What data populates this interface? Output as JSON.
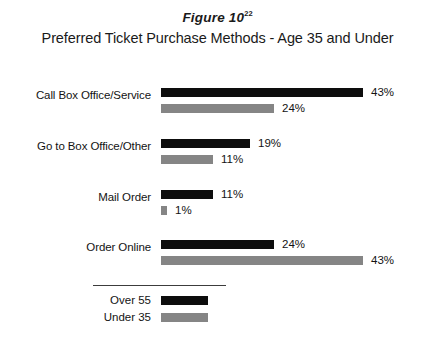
{
  "figure": {
    "number_label": "Figure 10",
    "footnote_marker": "22",
    "title": "Preferred Ticket Purchase Methods - Age 35 and Under"
  },
  "legend": {
    "items": [
      {
        "label": "Over 55",
        "series_key": "over55",
        "color": "#0d0d0d"
      },
      {
        "label": "Under 35",
        "series_key": "under35",
        "color": "#858585"
      }
    ]
  },
  "chart_data": {
    "type": "bar",
    "orientation": "horizontal",
    "title": "Preferred Ticket Purchase Methods - Age 35 and Under",
    "xlabel": "",
    "ylabel": "",
    "grid": false,
    "legend_position": "bottom",
    "value_suffix": "%",
    "xlim": [
      0,
      43
    ],
    "categories": [
      "Call Box Office/Service",
      "Go to Box Office/Other",
      "Mail Order",
      "Order Online"
    ],
    "series": [
      {
        "name": "Over 55",
        "color": "#0d0d0d",
        "values": [
          43,
          19,
          11,
          24
        ]
      },
      {
        "name": "Under 35",
        "color": "#858585",
        "values": [
          24,
          11,
          1,
          43
        ]
      }
    ],
    "value_labels": {
      "over55": [
        "43%",
        "19%",
        "11%",
        "24%"
      ],
      "under35": [
        "24%",
        "11%",
        "1%",
        "43%"
      ]
    }
  }
}
